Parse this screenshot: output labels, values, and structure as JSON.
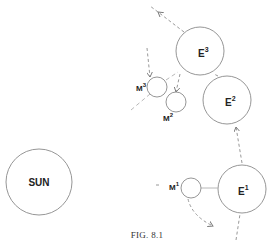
{
  "figure": {
    "caption": "FIG. 8.1",
    "sun": {
      "label": "SUN"
    },
    "earths": [
      {
        "base": "E",
        "sup": "1"
      },
      {
        "base": "E",
        "sup": "2"
      },
      {
        "base": "E",
        "sup": "3"
      }
    ],
    "moons": [
      {
        "base": "M",
        "sup": "1"
      },
      {
        "base": "M",
        "sup": "2"
      },
      {
        "base": "M",
        "sup": "3"
      }
    ],
    "colors": {
      "stroke": "#8a8a8a",
      "text": "#222222",
      "background": "#ffffff"
    }
  }
}
